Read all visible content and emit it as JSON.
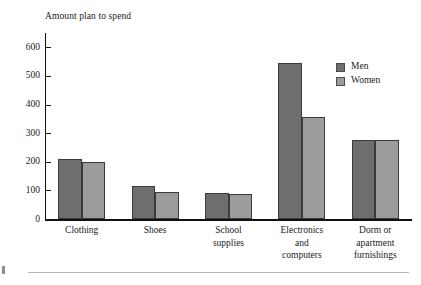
{
  "chart_data": {
    "type": "bar",
    "title": "Amount plan to spend",
    "xlabel": "",
    "ylabel": "Amount plan to spend",
    "ylim": [
      0,
      650
    ],
    "yticks": [
      0,
      100,
      200,
      300,
      400,
      500,
      600
    ],
    "ytick_labels": [
      "0",
      "100",
      "200",
      "300",
      "400",
      "500",
      "600"
    ],
    "grid": false,
    "legend_position": "upper right",
    "categories": [
      "Clothing",
      "Shoes",
      "School supplies",
      "Electronics and computers",
      "Dorm or apartment furnishings"
    ],
    "category_lines": [
      [
        "Clothing"
      ],
      [
        "Shoes"
      ],
      [
        "School",
        "supplies"
      ],
      [
        "Electronics",
        "and",
        "computers"
      ],
      [
        "Dorm or",
        "apartment",
        "furnishings"
      ]
    ],
    "series": [
      {
        "name": "Men",
        "color": "#6e6e6e",
        "values": [
          210,
          115,
          92,
          545,
          275
        ]
      },
      {
        "name": "Women",
        "color": "#9c9c9c",
        "values": [
          198,
          93,
          89,
          355,
          275
        ]
      }
    ]
  },
  "legend": {
    "items": [
      {
        "label": "Men",
        "color": "#6e6e6e"
      },
      {
        "label": "Women",
        "color": "#9c9c9c"
      }
    ]
  },
  "colors": {
    "men": "#6e6e6e",
    "women": "#9c9c9c",
    "axis": "#101010",
    "text": "#1a1a1a",
    "rule": "#b4b4b4"
  }
}
